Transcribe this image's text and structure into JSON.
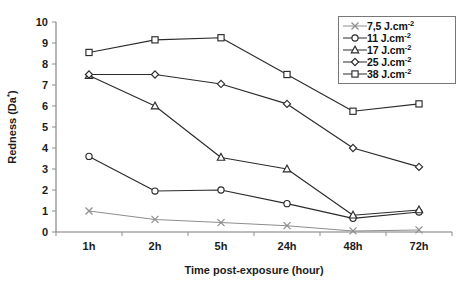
{
  "chart_data": {
    "type": "line",
    "title": "",
    "xlabel": "Time post-exposure (hour)",
    "ylabel": "Redness (Da*)",
    "categories": [
      "1h",
      "2h",
      "5h",
      "24h",
      "48h",
      "72h"
    ],
    "ylim": [
      0,
      10
    ],
    "yticks": [
      "0",
      "1",
      "2",
      "3",
      "4",
      "5",
      "6",
      "7",
      "8",
      "9",
      "10"
    ],
    "grid": false,
    "legend_position": "top-right",
    "series": [
      {
        "name": "7,5 J.cm",
        "exponent": "-2",
        "unit_label": "7,5 J.cm",
        "marker": "cross",
        "values": [
          1.0,
          0.6,
          0.45,
          0.3,
          0.05,
          0.1
        ]
      },
      {
        "name": "11 J.cm",
        "exponent": "-2",
        "unit_label": "11 J.cm",
        "marker": "circle",
        "values": [
          3.6,
          1.95,
          2.0,
          1.35,
          0.65,
          0.95
        ]
      },
      {
        "name": "17 J.cm",
        "exponent": "-2",
        "unit_label": "17 J.cm",
        "marker": "triangle",
        "values": [
          7.45,
          6.0,
          3.55,
          3.0,
          0.8,
          1.05
        ]
      },
      {
        "name": "25 J.cm",
        "exponent": "-2",
        "unit_label": "25 J.cm",
        "marker": "diamond",
        "values": [
          7.5,
          7.5,
          7.05,
          6.1,
          4.0,
          3.1
        ]
      },
      {
        "name": "38 J.cm",
        "exponent": "-2",
        "unit_label": "38 J.cm",
        "marker": "square",
        "values": [
          8.55,
          9.15,
          9.25,
          7.5,
          5.75,
          6.1
        ]
      }
    ]
  }
}
